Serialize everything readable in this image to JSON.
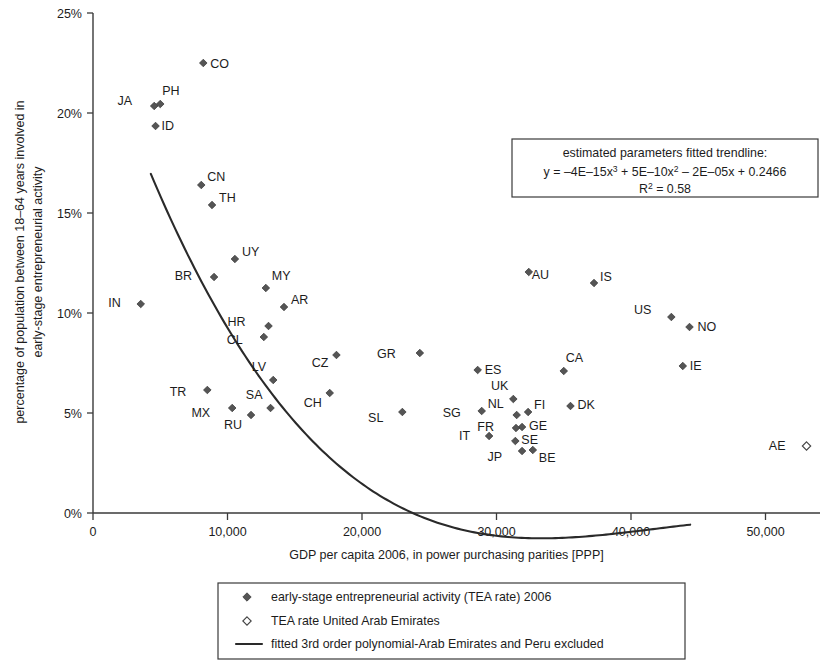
{
  "chart_data": {
    "type": "scatter",
    "title": "",
    "xlabel": "GDP per capita 2006, in power purchasing parities [PPP]",
    "ylabel": "percentage of population between 18–64 years involved in early-stage entrepreneurial activity",
    "ylabel_line1": "percentage of population between 18–64 years involved in",
    "ylabel_line2": "early-stage entrepreneurial activity",
    "xlim": [
      0,
      55500
    ],
    "ylim": [
      0,
      0.25
    ],
    "xticks": [
      0,
      10000,
      20000,
      30000,
      40000,
      50000
    ],
    "xticklabels": [
      "0",
      "10,000",
      "20,000",
      "30,000",
      "40,000",
      "50,000"
    ],
    "yticks": [
      0,
      0.05,
      0.1,
      0.15,
      0.2,
      0.25
    ],
    "yticklabels": [
      "0%",
      "5%",
      "10%",
      "15%",
      "20%",
      "25%"
    ],
    "grid": false,
    "legend_position": "below-axes",
    "series": [
      {
        "name": "early-stage entrepreneurial activity (TEA rate) 2006",
        "marker": "filled-diamond",
        "points": [
          {
            "code": "CO",
            "x": 8200,
            "y": 0.225,
            "label_dx": 7,
            "label_dy": 5
          },
          {
            "code": "JA",
            "x": 4550,
            "y": 0.2035,
            "label_dx": -22,
            "label_dy": -1
          },
          {
            "code": "PH",
            "x": 5000,
            "y": 0.2045,
            "label_dx": 2,
            "label_dy": -9
          },
          {
            "code": "ID",
            "x": 4650,
            "y": 0.1935,
            "label_dx": 6,
            "label_dy": 4
          },
          {
            "code": "CN",
            "x": 8050,
            "y": 0.164,
            "label_dx": 6,
            "label_dy": -4
          },
          {
            "code": "TH",
            "x": 8850,
            "y": 0.154,
            "label_dx": 7,
            "label_dy": -3
          },
          {
            "code": "UY",
            "x": 10550,
            "y": 0.127,
            "label_dx": 7,
            "label_dy": -3
          },
          {
            "code": "BR",
            "x": 9000,
            "y": 0.118,
            "label_dx": -22,
            "label_dy": 3
          },
          {
            "code": "MY",
            "x": 12850,
            "y": 0.1125,
            "label_dx": 6,
            "label_dy": -8
          },
          {
            "code": "AR",
            "x": 14200,
            "y": 0.103,
            "label_dx": 7,
            "label_dy": -3
          },
          {
            "code": "IN",
            "x": 3550,
            "y": 0.1045,
            "label_dx": -20,
            "label_dy": 3
          },
          {
            "code": "HR",
            "x": 13050,
            "y": 0.0935,
            "label_dx": -23,
            "label_dy": 0
          },
          {
            "code": "CL",
            "x": 12700,
            "y": 0.088,
            "label_dx": -21,
            "label_dy": 7
          },
          {
            "code": "LV",
            "x": 13400,
            "y": 0.0665,
            "label_dx": -7,
            "label_dy": -9
          },
          {
            "code": "CZ",
            "x": 18100,
            "y": 0.079,
            "label_dx": -8,
            "label_dy": 12
          },
          {
            "code": "GR",
            "x": 24300,
            "y": 0.08,
            "label_dx": -24,
            "label_dy": 5
          },
          {
            "code": "ES",
            "x": 28600,
            "y": 0.0715,
            "label_dx": 7,
            "label_dy": 4
          },
          {
            "code": "CA",
            "x": 35000,
            "y": 0.071,
            "label_dx": 2,
            "label_dy": -9
          },
          {
            "code": "AU",
            "x": 32400,
            "y": 0.1205,
            "label_dx": 3,
            "label_dy": 7
          },
          {
            "code": "IS",
            "x": 37250,
            "y": 0.115,
            "label_dx": 6,
            "label_dy": -2
          },
          {
            "code": "US",
            "x": 43000,
            "y": 0.098,
            "label_dx": -20,
            "label_dy": -3
          },
          {
            "code": "NO",
            "x": 44350,
            "y": 0.093,
            "label_dx": 8,
            "label_dy": 4
          },
          {
            "code": "IE",
            "x": 43850,
            "y": 0.0735,
            "label_dx": 7,
            "label_dy": 4
          },
          {
            "code": "TR",
            "x": 8500,
            "y": 0.0615,
            "label_dx": -21,
            "label_dy": 6
          },
          {
            "code": "MX",
            "x": 10350,
            "y": 0.0525,
            "label_dx": -22,
            "label_dy": 9
          },
          {
            "code": "RU",
            "x": 11750,
            "y": 0.049,
            "label_dx": -9,
            "label_dy": 14
          },
          {
            "code": "SA",
            "x": 13200,
            "y": 0.0525,
            "label_dx": -8,
            "label_dy": -9
          },
          {
            "code": "CH",
            "x": 17600,
            "y": 0.06,
            "label_dx": -8,
            "label_dy": 14
          },
          {
            "code": "SL",
            "x": 23000,
            "y": 0.0505,
            "label_dx": -19,
            "label_dy": 10
          },
          {
            "code": "SG",
            "x": 28900,
            "y": 0.051,
            "label_dx": -21,
            "label_dy": 6
          },
          {
            "code": "UK",
            "x": 31250,
            "y": 0.057,
            "label_dx": -5,
            "label_dy": -9
          },
          {
            "code": "FI",
            "x": 32350,
            "y": 0.0505,
            "label_dx": 6,
            "label_dy": -3
          },
          {
            "code": "DK",
            "x": 35500,
            "y": 0.0535,
            "label_dx": 7,
            "label_dy": 3
          },
          {
            "code": "NL",
            "x": 31500,
            "y": 0.049,
            "label_dx": -13,
            "label_dy": -7
          },
          {
            "code": "GE",
            "x": 31900,
            "y": 0.043,
            "label_dx": 7,
            "label_dy": 3
          },
          {
            "code": "FR",
            "x": 31450,
            "y": 0.0425,
            "label_dx": -22,
            "label_dy": 3
          },
          {
            "code": "IT",
            "x": 29450,
            "y": 0.0385,
            "label_dx": -19,
            "label_dy": 4
          },
          {
            "code": "SE",
            "x": 31400,
            "y": 0.036,
            "label_dx": 6,
            "label_dy": 3
          },
          {
            "code": "JP",
            "x": 31900,
            "y": 0.031,
            "label_dx": -20,
            "label_dy": 10
          },
          {
            "code": "BE",
            "x": 32700,
            "y": 0.0315,
            "label_dx": 6,
            "label_dy": 12
          }
        ]
      },
      {
        "name": "TEA rate United Arab Emirates",
        "marker": "open-diamond",
        "points": [
          {
            "code": "AE",
            "x": 53050,
            "y": 0.0335,
            "label_dx": -21,
            "label_dy": 4
          }
        ]
      }
    ],
    "trendline": {
      "label": "fitted 3rd order polynomial-Arab Emirates and Peru excluded",
      "equation_title": "estimated parameters fitted trendline:",
      "equation": "y = –4E–15x³ + 5E–10x² – 2E–05x  + 0.2466",
      "r_squared_label": "R² = 0.58",
      "coefficients": {
        "x3": -4e-15,
        "x2": 5e-10,
        "x1": -2e-05,
        "c": 0.2466
      },
      "x_start": 4300,
      "x_end": 44400
    }
  },
  "equation_box": {
    "line1": "estimated parameters fitted trendline:",
    "eq_y": "y = ",
    "eq_t1": "–4E–15x",
    "eq_t1_sup": "3",
    "eq_t2": " + 5E–10x",
    "eq_t2_sup": "2",
    "eq_t3": " – 2E–05x  + 0.2466",
    "r_label": "R",
    "r_sup": "2",
    "r_value": " = 0.58"
  },
  "legend": {
    "items": [
      {
        "marker": "filled-diamond",
        "label": "early-stage entrepreneurial activity (TEA rate) 2006"
      },
      {
        "marker": "open-diamond",
        "label": "TEA rate United Arab Emirates"
      },
      {
        "marker": "line",
        "label": "fitted 3rd order polynomial-Arab Emirates and Peru excluded"
      }
    ]
  },
  "colors": {
    "marker_fill": "#555555",
    "marker_stroke": "#333333",
    "axis": "#3a3a3a",
    "trend": "#2a2a2a",
    "text": "#1c1c1c",
    "background": "#ffffff"
  }
}
